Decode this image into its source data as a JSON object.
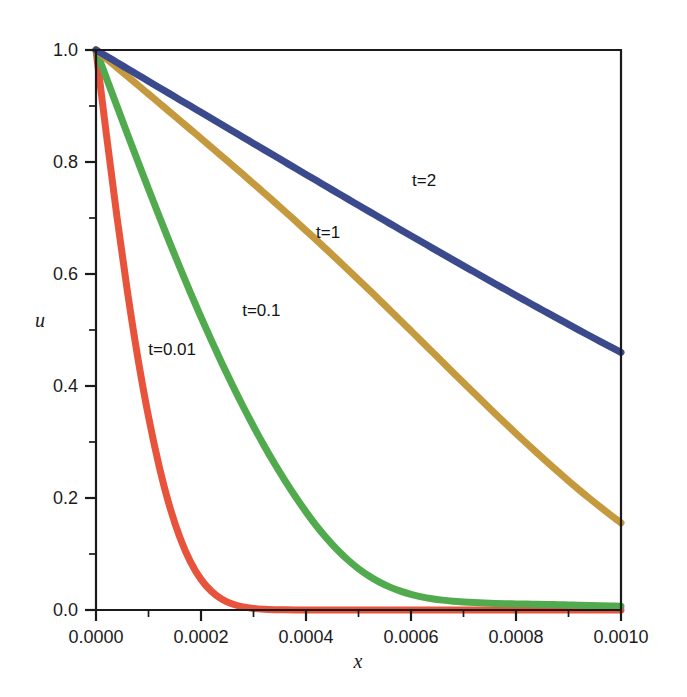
{
  "chart_data": {
    "type": "line",
    "title": "",
    "subtitle": "",
    "xlabel": "x",
    "ylabel": "u",
    "xlim": [
      0.0,
      0.001
    ],
    "ylim": [
      0.0,
      1.0
    ],
    "grid": false,
    "legend_position": "inline-annotations",
    "x_ticks": [
      0.0,
      0.0002,
      0.0004,
      0.0006,
      0.0008,
      0.001
    ],
    "x_tick_labels": [
      "0.0000",
      "0.0002",
      "0.0004",
      "0.0006",
      "0.0008",
      "0.0010"
    ],
    "x_minor_ticks": [
      0.0001,
      0.0003,
      0.0005,
      0.0007,
      0.0009
    ],
    "y_ticks": [
      0.0,
      0.2,
      0.4,
      0.6,
      0.8,
      1.0
    ],
    "y_tick_labels": [
      "0.0",
      "0.2",
      "0.4",
      "0.6",
      "0.8",
      "1.0"
    ],
    "y_minor_ticks": [
      0.1,
      0.3,
      0.5,
      0.7,
      0.9
    ],
    "x": [
      0.0,
      2e-05,
      4e-05,
      6e-05,
      8e-05,
      0.0001,
      0.00012,
      0.00014,
      0.00016,
      0.00018,
      0.0002,
      0.00022,
      0.00024,
      0.00026,
      0.00028,
      0.0003,
      0.00032,
      0.00034,
      0.00036,
      0.00038,
      0.0004,
      0.00042,
      0.00044,
      0.00046,
      0.00048,
      0.0005,
      0.00052,
      0.00054,
      0.00056,
      0.00058,
      0.0006,
      0.00062,
      0.00064,
      0.00066,
      0.00068,
      0.0007,
      0.00072,
      0.00074,
      0.00076,
      0.00078,
      0.0008,
      0.00082,
      0.00084,
      0.00086,
      0.00088,
      0.0009,
      0.00092,
      0.00094,
      0.00096,
      0.00098,
      0.001
    ],
    "series": [
      {
        "name": "t=0.01",
        "label": "t=0.01",
        "color": "#e8533b",
        "label_x": 0.000145,
        "label_y": 0.455,
        "values": [
          1.0,
          0.8475,
          0.7016,
          0.5677,
          0.4485,
          0.3452,
          0.2579,
          0.1858,
          0.1291,
          0.0859,
          0.0547,
          0.0333,
          0.0193,
          0.0106,
          0.0055,
          0.0027,
          0.0013,
          0.0006,
          0.0003,
          0.00012,
          5e-05,
          2e-05,
          1e-05,
          0.0,
          0.0,
          0.0,
          0.0,
          0.0,
          0.0,
          0.0,
          0.0,
          0.0,
          0.0,
          0.0,
          0.0,
          0.0,
          0.0,
          0.0,
          0.0,
          0.0,
          0.0,
          0.0,
          0.0,
          0.0,
          0.0,
          0.0,
          0.0,
          0.0,
          0.0,
          0.0,
          0.0
        ]
      },
      {
        "name": "t=0.1",
        "label": "t=0.1",
        "color": "#51ab4e",
        "label_x": 0.000315,
        "label_y": 0.525,
        "values": [
          1.0,
          0.9497,
          0.8995,
          0.8497,
          0.8004,
          0.7518,
          0.7039,
          0.657,
          0.6111,
          0.5664,
          0.523,
          0.4809,
          0.4403,
          0.4013,
          0.3638,
          0.328,
          0.2939,
          0.2616,
          0.231,
          0.2022,
          0.1752,
          0.15,
          0.1275,
          0.1072,
          0.0893,
          0.0738,
          0.0607,
          0.0497,
          0.0408,
          0.0336,
          0.0279,
          0.0235,
          0.0201,
          0.0176,
          0.0157,
          0.0143,
          0.0132,
          0.0124,
          0.0118,
          0.0113,
          0.0109,
          0.0105,
          0.0102,
          0.0099,
          0.0095,
          0.0091,
          0.0087,
          0.0082,
          0.0077,
          0.0072,
          0.0067
        ]
      },
      {
        "name": "t=1",
        "label": "t=1",
        "color": "#c59a3e",
        "label_x": 0.000442,
        "label_y": 0.665,
        "values": [
          1.0,
          0.9843,
          0.9686,
          0.9529,
          0.9372,
          0.9214,
          0.9056,
          0.8898,
          0.874,
          0.8581,
          0.8422,
          0.8262,
          0.8102,
          0.794,
          0.7778,
          0.7614,
          0.745,
          0.7283,
          0.7116,
          0.6947,
          0.6776,
          0.6604,
          0.643,
          0.6254,
          0.6077,
          0.5898,
          0.5718,
          0.5536,
          0.5354,
          0.517,
          0.4985,
          0.48,
          0.4614,
          0.4429,
          0.4243,
          0.4058,
          0.3874,
          0.3691,
          0.351,
          0.333,
          0.3152,
          0.2977,
          0.2805,
          0.2635,
          0.2469,
          0.2307,
          0.2148,
          0.1993,
          0.1843,
          0.1697,
          0.1556
        ]
      },
      {
        "name": "t=2",
        "label": "t=2",
        "color": "#3b4a8c",
        "label_x": 0.000625,
        "label_y": 0.757,
        "values": [
          1.0,
          0.9889,
          0.9777,
          0.9666,
          0.9555,
          0.9443,
          0.9332,
          0.9221,
          0.9109,
          0.8998,
          0.8887,
          0.8776,
          0.8665,
          0.8554,
          0.8443,
          0.8332,
          0.8221,
          0.811,
          0.7999,
          0.7888,
          0.7778,
          0.7668,
          0.7557,
          0.7447,
          0.7337,
          0.7228,
          0.7118,
          0.7009,
          0.69,
          0.6791,
          0.6683,
          0.6575,
          0.6467,
          0.6359,
          0.6252,
          0.6145,
          0.6039,
          0.5933,
          0.5827,
          0.5722,
          0.5617,
          0.5513,
          0.5409,
          0.5306,
          0.5203,
          0.5101,
          0.4999,
          0.4898,
          0.4798,
          0.4698,
          0.4599
        ]
      }
    ]
  },
  "plot": {
    "frame_color": "#1a1a1a",
    "background": "#ffffff"
  }
}
